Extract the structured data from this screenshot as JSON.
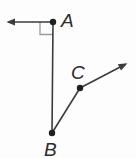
{
  "figure": {
    "background_color": "#fdfdfd",
    "line_color": "#3c3c3c",
    "point_color": "#1f1f1f",
    "label_color": "#2b2b2b",
    "right_angle_color": "#9a9a9a",
    "points": {
      "A": {
        "x": 53,
        "y": 22,
        "r": 3.2
      },
      "B": {
        "x": 52,
        "y": 133,
        "r": 3.2
      },
      "C": {
        "x": 80,
        "y": 88,
        "r": 3.2
      }
    },
    "labels": {
      "A": {
        "text": "A",
        "x": 61,
        "y": 27
      },
      "B": {
        "text": "B",
        "x": 44,
        "y": 156
      },
      "C": {
        "text": "C",
        "x": 71,
        "y": 79
      }
    },
    "segments": {
      "AB": {
        "x1": 53,
        "y1": 22,
        "x2": 52,
        "y2": 133
      },
      "BC": {
        "x1": 52,
        "y1": 133,
        "x2": 80,
        "y2": 88
      }
    },
    "rays": {
      "from_A_west": {
        "x1": 53,
        "y1": 22,
        "x2": 9,
        "y2": 22
      },
      "from_C_northeast": {
        "x1": 80,
        "y1": 88,
        "x2": 125,
        "y2": 64.5
      }
    },
    "right_angle_marker": {
      "points": "40,22 40,34.5 53,34.5"
    }
  }
}
